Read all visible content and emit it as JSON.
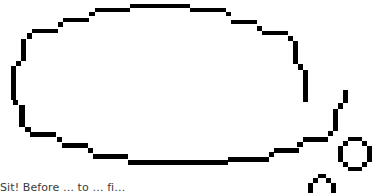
{
  "scene": {
    "type": "thought-bubble",
    "outline_color": "#000000",
    "fill_color": "#ffffff",
    "background": "#ffffff"
  },
  "caption": {
    "text": "Sit! Before … to … fi…"
  }
}
